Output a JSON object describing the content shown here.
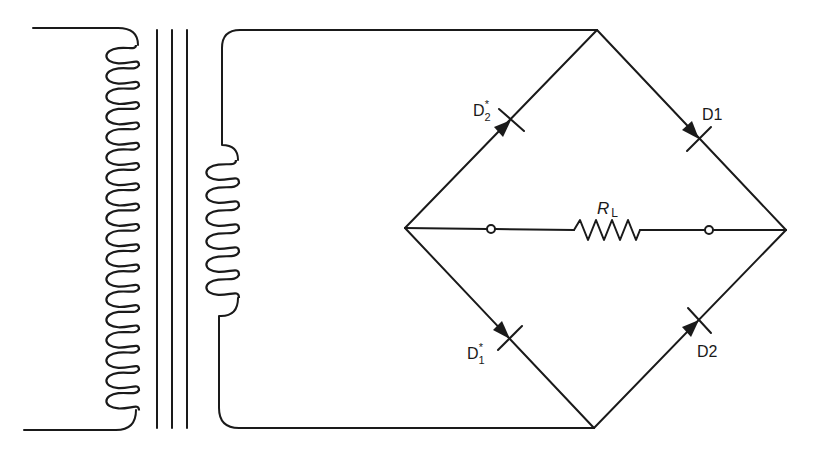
{
  "diagram": {
    "type": "full-wave bridge rectifier with transformer",
    "colors": {
      "ink": "#1a1a1a",
      "background": "#ffffff"
    },
    "transformer": {
      "primary_turns_visible": 18,
      "secondary_turns_visible": 6,
      "core_lines": 3
    },
    "labels": {
      "d2_star": {
        "base": "D",
        "sub": "2",
        "sup": "*"
      },
      "d1": "D1",
      "d1_star": {
        "base": "D",
        "sub": "1",
        "sup": "*"
      },
      "d2": "D2",
      "load_resistor": {
        "base": "R",
        "sub": "L"
      }
    }
  }
}
